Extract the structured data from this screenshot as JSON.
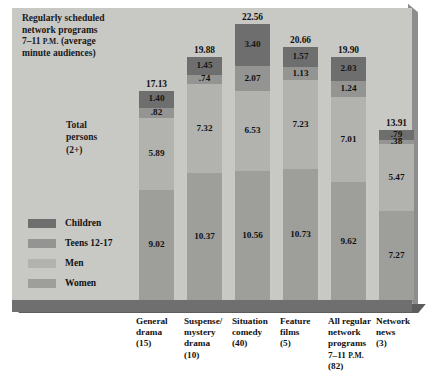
{
  "chart_data": {
    "type": "bar",
    "title_lines": [
      "Regularly scheduled",
      "network programs",
      "7–11 P.M. (average",
      "minute audiences)"
    ],
    "row_label_lines": [
      "Total",
      "persons",
      "(2+)"
    ],
    "stacked": true,
    "xlabel": "",
    "ylabel": "",
    "ylim": [
      0,
      22.56
    ],
    "grid": false,
    "legend_position": "left-inside",
    "categories": [
      "General drama (15)",
      "Suspense/mystery drama (10)",
      "Situation comedy (40)",
      "Feature films (5)",
      "All regular network programs 7–11 P.M. (82)",
      "Network news (3)"
    ],
    "category_label_lines": [
      [
        "General",
        "drama",
        "(15)"
      ],
      [
        "Suspense/",
        "mystery",
        "drama",
        "(10)"
      ],
      [
        "Situation",
        "comedy",
        "(40)"
      ],
      [
        "Feature",
        "films",
        "(5)"
      ],
      [
        "All regular",
        "network",
        "programs",
        "7–11 P.M.",
        "(82)"
      ],
      [
        "Network",
        "news",
        "(3)"
      ]
    ],
    "series": [
      {
        "name": "Children",
        "color": "#6e6e6e",
        "values": [
          1.4,
          1.45,
          3.4,
          1.57,
          2.03,
          0.79
        ],
        "labels": [
          "1.40",
          "1.45",
          "3.40",
          "1.57",
          "2.03",
          ".79"
        ]
      },
      {
        "name": "Teens 12-17",
        "color": "#949492",
        "values": [
          0.82,
          0.74,
          2.07,
          1.13,
          1.24,
          0.38
        ],
        "labels": [
          ".82",
          ".74",
          "2.07",
          "1.13",
          "1.24",
          ".38"
        ]
      },
      {
        "name": "Men",
        "color": "#b2b2af",
        "values": [
          5.89,
          7.32,
          6.53,
          7.23,
          7.01,
          5.47
        ],
        "labels": [
          "5.89",
          "7.32",
          "6.53",
          "7.23",
          "7.01",
          "5.47"
        ]
      },
      {
        "name": "Women",
        "color": "#9e9e9b",
        "values": [
          9.02,
          10.37,
          10.56,
          10.73,
          9.62,
          7.27
        ],
        "labels": [
          "9.02",
          "10.37",
          "10.56",
          "10.73",
          "9.62",
          "7.27"
        ]
      }
    ],
    "totals": [
      17.13,
      19.88,
      22.56,
      20.66,
      19.9,
      13.91
    ],
    "total_labels": [
      "17.13",
      "19.88",
      "22.56",
      "20.66",
      "19.90",
      "13.91"
    ],
    "legend": [
      {
        "label": "Children",
        "color": "#6e6e6e"
      },
      {
        "label": "Teens 12-17",
        "color": "#949492"
      },
      {
        "label": "Men",
        "color": "#b2b2af"
      },
      {
        "label": "Women",
        "color": "#9e9e9b"
      }
    ],
    "panel_color": "#c8c8c5",
    "base_color": "#6f6f6f"
  }
}
